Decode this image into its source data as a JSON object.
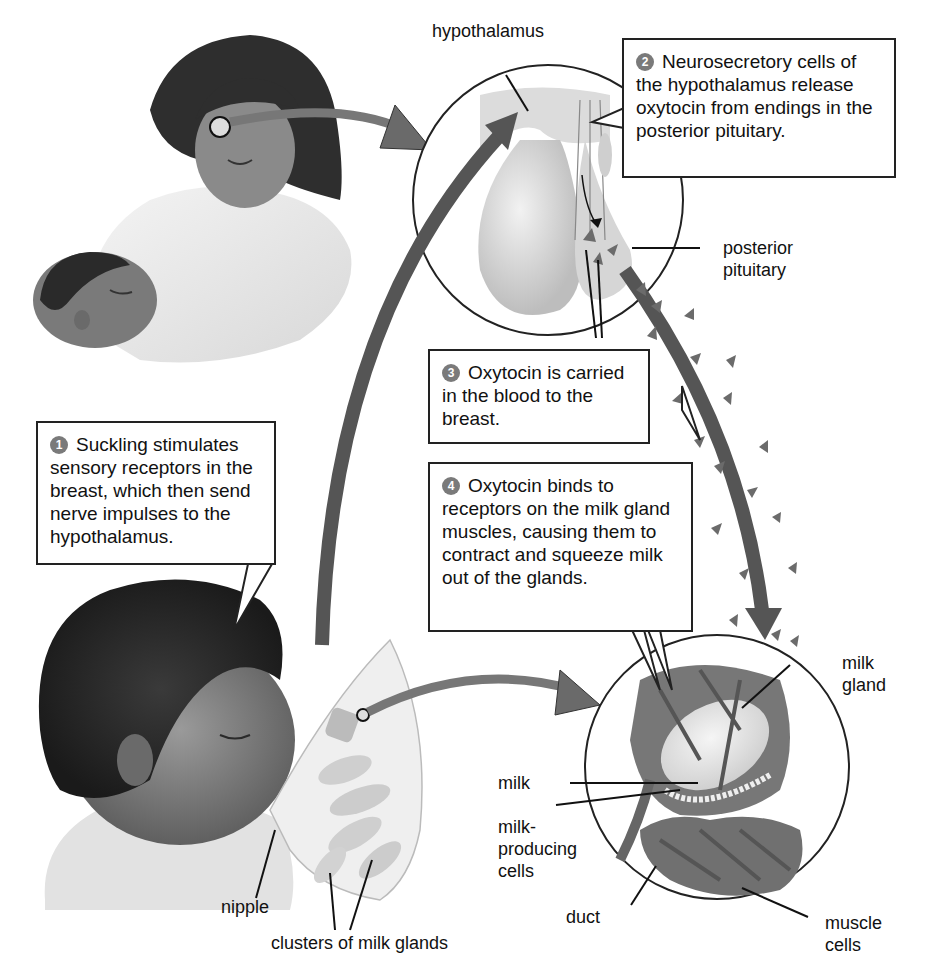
{
  "colors": {
    "arrow": "#555555",
    "hormone": "#6b6b6b",
    "badge": "#7a7a7a",
    "outline": "#222222"
  },
  "steps": [
    {
      "number": "1",
      "text": "Suckling stimulates sensory receptors in the breast, which then send nerve impulses to the hypothalamus."
    },
    {
      "number": "2",
      "text": "Neurosecretory cells of the hypothalamus release oxytocin from endings in the posterior pituitary."
    },
    {
      "number": "3",
      "text": "Oxytocin is carried in the blood to the breast."
    },
    {
      "number": "4",
      "text": "Oxytocin binds to receptors on the milk gland muscles, causing them to contract and squeeze milk out of the glands."
    }
  ],
  "labels": {
    "hypothalamus": "hypothalamus",
    "posterior_pituitary_1": "posterior",
    "posterior_pituitary_2": "pituitary",
    "nipple": "nipple",
    "clusters": "clusters of milk glands",
    "milk_gland_1": "milk",
    "milk_gland_2": "gland",
    "milk": "milk",
    "milk_producing_1": "milk-",
    "milk_producing_2": "producing",
    "milk_producing_3": "cells",
    "duct": "duct",
    "muscle_cells_1": "muscle",
    "muscle_cells_2": "cells"
  }
}
